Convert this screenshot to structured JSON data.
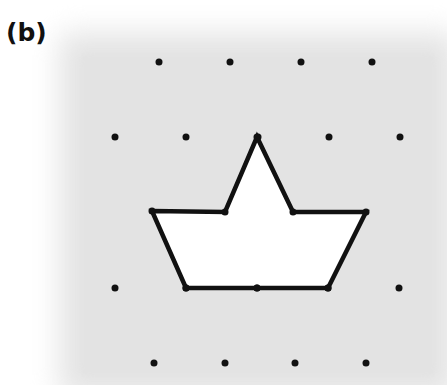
{
  "figure": {
    "label": "(b)",
    "background_color": "#e3e3e3",
    "dot_color": "#111111",
    "outline_color": "#111111",
    "fill_color": "#ffffff",
    "dot_rows": [
      {
        "y": 62,
        "x": [
          159,
          230,
          301,
          372
        ]
      },
      {
        "y": 137,
        "x": [
          115,
          186,
          258,
          329,
          400
        ]
      },
      {
        "y": 288,
        "x": [
          115,
          186,
          257,
          328,
          399
        ]
      },
      {
        "y": 363,
        "x": [
          154,
          225,
          295,
          366
        ]
      }
    ],
    "shape": {
      "name": "boat",
      "vertices": [
        [
          152,
          211
        ],
        [
          225,
          212
        ],
        [
          257,
          137
        ],
        [
          293,
          212
        ],
        [
          366,
          212
        ],
        [
          328,
          288
        ],
        [
          186,
          288
        ]
      ],
      "extra_dot": [
        257,
        288
      ]
    }
  }
}
